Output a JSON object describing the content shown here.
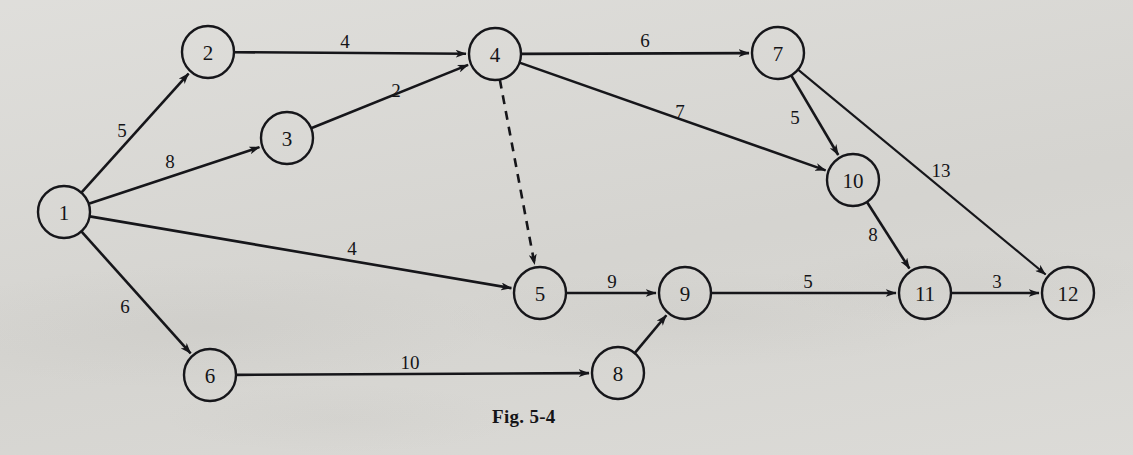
{
  "figure": {
    "caption": "Fig. 5-4",
    "caption_x": 492,
    "caption_y": 406,
    "background_color": "#d9d8d4",
    "ink_color": "#16161a"
  },
  "chart_data": {
    "type": "diagram",
    "subtype": "directed-weighted-graph",
    "title": "Fig. 5-4",
    "node_radius": 26,
    "nodes": [
      {
        "id": "1",
        "label": "1",
        "x": 64,
        "y": 212
      },
      {
        "id": "2",
        "label": "2",
        "x": 208,
        "y": 52
      },
      {
        "id": "3",
        "label": "3",
        "x": 287,
        "y": 138
      },
      {
        "id": "4",
        "label": "4",
        "x": 495,
        "y": 54
      },
      {
        "id": "5",
        "label": "5",
        "x": 540,
        "y": 293
      },
      {
        "id": "6",
        "label": "6",
        "x": 210,
        "y": 375
      },
      {
        "id": "7",
        "label": "7",
        "x": 778,
        "y": 53
      },
      {
        "id": "8",
        "label": "8",
        "x": 618,
        "y": 373
      },
      {
        "id": "9",
        "label": "9",
        "x": 685,
        "y": 293
      },
      {
        "id": "10",
        "label": "10",
        "x": 853,
        "y": 180
      },
      {
        "id": "11",
        "label": "11",
        "x": 925,
        "y": 293
      },
      {
        "id": "12",
        "label": "12",
        "x": 1068,
        "y": 293
      }
    ],
    "edges": [
      {
        "from": "1",
        "to": "2",
        "weight": "5",
        "label_x": 122,
        "label_y": 130,
        "style": "solid",
        "arrow": true
      },
      {
        "from": "1",
        "to": "3",
        "weight": "8",
        "label_x": 170,
        "label_y": 161,
        "style": "solid",
        "arrow": true
      },
      {
        "from": "1",
        "to": "5",
        "weight": "4",
        "label_x": 352,
        "label_y": 248,
        "style": "solid",
        "arrow": true
      },
      {
        "from": "1",
        "to": "6",
        "weight": "6",
        "label_x": 125,
        "label_y": 306,
        "style": "solid",
        "arrow": true
      },
      {
        "from": "2",
        "to": "4",
        "weight": "4",
        "label_x": 345,
        "label_y": 41,
        "style": "solid",
        "arrow": true
      },
      {
        "from": "3",
        "to": "4",
        "weight": "2",
        "label_x": 396,
        "label_y": 90,
        "style": "solid",
        "arrow": true
      },
      {
        "from": "4",
        "to": "7",
        "weight": "6",
        "label_x": 645,
        "label_y": 40,
        "style": "solid",
        "arrow": true
      },
      {
        "from": "4",
        "to": "10",
        "weight": "7",
        "label_x": 680,
        "label_y": 111,
        "style": "solid",
        "arrow": true
      },
      {
        "from": "4",
        "to": "5",
        "weight": "",
        "label_x": 0,
        "label_y": 0,
        "style": "dashed",
        "arrow": true
      },
      {
        "from": "5",
        "to": "9",
        "weight": "9",
        "label_x": 612,
        "label_y": 281,
        "style": "solid",
        "arrow": true
      },
      {
        "from": "6",
        "to": "8",
        "weight": "10",
        "label_x": 410,
        "label_y": 362,
        "style": "solid",
        "arrow": true
      },
      {
        "from": "7",
        "to": "10",
        "weight": "5",
        "label_x": 795,
        "label_y": 117,
        "style": "solid",
        "arrow": true
      },
      {
        "from": "7",
        "to": "12",
        "weight": "13",
        "label_x": 941,
        "label_y": 170,
        "style": "solid",
        "arrow": true
      },
      {
        "from": "8",
        "to": "9",
        "weight": "",
        "label_x": 0,
        "label_y": 0,
        "style": "solid",
        "arrow": true
      },
      {
        "from": "9",
        "to": "11",
        "weight": "5",
        "label_x": 808,
        "label_y": 281,
        "style": "solid",
        "arrow": true
      },
      {
        "from": "10",
        "to": "11",
        "weight": "8",
        "label_x": 873,
        "label_y": 234,
        "style": "solid",
        "arrow": true
      },
      {
        "from": "11",
        "to": "12",
        "weight": "3",
        "label_x": 997,
        "label_y": 281,
        "style": "solid",
        "arrow": true
      }
    ]
  }
}
